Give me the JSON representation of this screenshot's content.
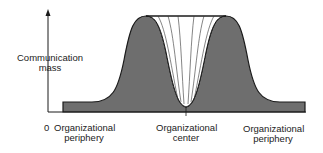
{
  "diagram": {
    "y_axis_label_line1": "Communication",
    "y_axis_label_line2": "mass",
    "origin_label": "0",
    "x_labels": [
      {
        "line1": "Organizational",
        "line2": "periphery"
      },
      {
        "line1": "Organizational",
        "line2": "center"
      },
      {
        "line1": "Organizational",
        "line2": "periphery"
      }
    ],
    "fill_color": "#6e6e6e",
    "line_color": "#1a1a1a"
  }
}
